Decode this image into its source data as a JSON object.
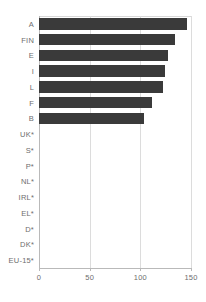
{
  "chart_data": {
    "type": "bar",
    "orientation": "horizontal",
    "title": "",
    "subtitle": "",
    "xlabel": "",
    "ylabel": "",
    "categories": [
      "A",
      "FIN",
      "E",
      "I",
      "L",
      "F",
      "B",
      "UK*",
      "S*",
      "P*",
      "NL*",
      "IRL*",
      "EL*",
      "D*",
      "DK*",
      "EU-15*"
    ],
    "values": [
      146,
      134,
      127,
      124,
      122,
      112,
      104,
      0,
      0,
      0,
      0,
      0,
      0,
      0,
      0,
      0
    ],
    "xlim": [
      0,
      150
    ],
    "xticks": [
      0,
      50,
      100,
      150
    ],
    "xtick_labels": [
      "0",
      "50",
      "100",
      "150"
    ],
    "gridlines": true,
    "gridline_values": [
      50,
      100,
      150
    ],
    "legend": null,
    "bar_color": "#3a3a3a",
    "gridline_color": "#dcdcdc",
    "axis_color": "#b9b9b9",
    "label_color": "#6e6e6e",
    "note": "Categories marked with * have no bar displayed"
  }
}
